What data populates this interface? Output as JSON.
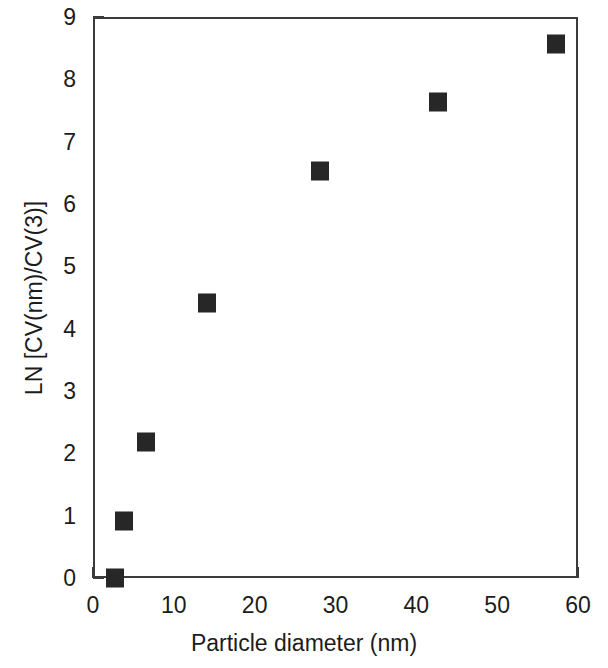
{
  "chart_data": {
    "type": "scatter",
    "title": "",
    "xlabel": "Particle diameter (nm)",
    "ylabel": "LN [CV(nm)/CV(3)]",
    "xlim": [
      0,
      60
    ],
    "ylim": [
      0,
      9
    ],
    "grid": false,
    "legend": null,
    "marker": {
      "shape": "square",
      "color": "#272727",
      "size_px": 18
    },
    "xticks": [
      0,
      10,
      20,
      30,
      40,
      50,
      60
    ],
    "xtick_labels": [
      "0",
      "10",
      "20",
      "30",
      "40",
      "50",
      "60"
    ],
    "x_minor_interval": 2,
    "yticks": [
      0,
      1,
      2,
      3,
      4,
      5,
      6,
      7,
      8,
      9
    ],
    "ytick_labels": [
      "0",
      "1",
      "2",
      "3",
      "4",
      "5",
      "6",
      "7",
      "8",
      "9"
    ],
    "y_minor_interval": 0.2,
    "x": [
      2.5,
      3.6,
      6.3,
      13.9,
      27.8,
      42.4,
      57.0
    ],
    "y": [
      0.03,
      0.95,
      2.21,
      4.44,
      6.56,
      7.67,
      8.6
    ],
    "points": [
      {
        "x": 2.5,
        "y": 0.03
      },
      {
        "x": 3.6,
        "y": 0.95
      },
      {
        "x": 6.3,
        "y": 2.21
      },
      {
        "x": 13.9,
        "y": 4.44
      },
      {
        "x": 27.8,
        "y": 6.56
      },
      {
        "x": 42.4,
        "y": 7.67
      },
      {
        "x": 57.0,
        "y": 8.6
      }
    ],
    "axis_color": "#3b3b3b",
    "background": "#ffffff"
  }
}
